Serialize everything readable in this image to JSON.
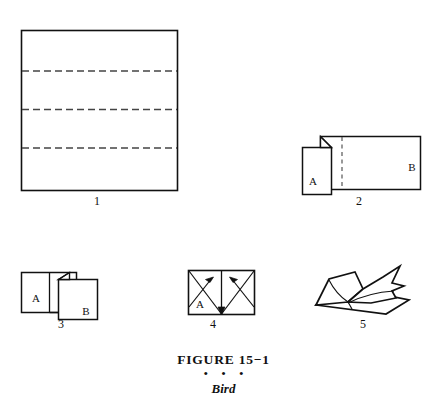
{
  "caption": {
    "title": "FIGURE  15−1",
    "dots": "• • •",
    "subtitle": "Bird"
  },
  "colors": {
    "stroke": "#111111",
    "fold_dash": "#444444",
    "background": "#ffffff"
  },
  "figure": {
    "name": "Bird",
    "number": "15-1",
    "step_count": 5
  },
  "steps": [
    {
      "number": "1",
      "description": "Square sheet with three horizontal dashed fold lines",
      "number_x": 97,
      "number_y": 201,
      "labels": []
    },
    {
      "number": "2",
      "description": "Folded strip with flap A on the left, corner fold, and panel B on the right, vertical dashed fold line",
      "number_x": 359,
      "number_y": 201,
      "labels": [
        {
          "text": "A",
          "x": 313,
          "y": 182
        },
        {
          "text": "B",
          "x": 412,
          "y": 168
        }
      ]
    },
    {
      "number": "3",
      "description": "Panel A on the left with divider, folded panel B overlapping to the right",
      "number_x": 61,
      "number_y": 324,
      "labels": [
        {
          "text": "A",
          "x": 36,
          "y": 299
        },
        {
          "text": "B",
          "x": 86,
          "y": 312
        }
      ]
    },
    {
      "number": "4",
      "description": "Rectangle divided in half with crossing valley folds and two arrows pointing inward",
      "number_x": 213,
      "number_y": 324,
      "labels": [
        {
          "text": "A",
          "x": 200,
          "y": 305
        }
      ]
    },
    {
      "number": "5",
      "description": "Completed three-dimensional bird shape with raised wings and beak",
      "number_x": 363,
      "number_y": 324,
      "labels": []
    }
  ]
}
